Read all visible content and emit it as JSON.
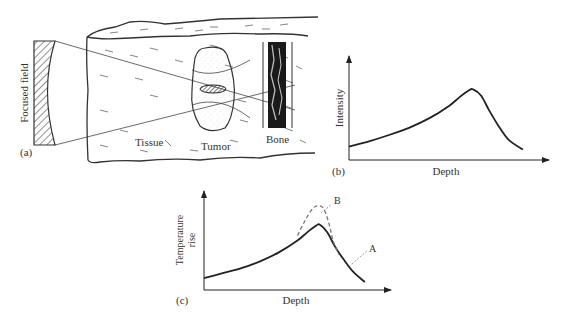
{
  "panel_a": {
    "panel_label": "(a)",
    "transducer_label": "Focused field",
    "region_labels": {
      "tissue": "Tissue",
      "tumor": "Tumor",
      "bone": "Bone"
    }
  },
  "chart_data": [
    {
      "type": "line",
      "panel_label": "(b)",
      "title": "",
      "xlabel": "Depth",
      "ylabel": "Intensity",
      "axis_ticks": "none",
      "series": [
        {
          "name": "Intensity",
          "style": "solid",
          "x": [
            0.0,
            0.1,
            0.2,
            0.3,
            0.4,
            0.5,
            0.55,
            0.6,
            0.62,
            0.66,
            0.7,
            0.75,
            0.8,
            0.87
          ],
          "y": [
            0.13,
            0.18,
            0.24,
            0.31,
            0.4,
            0.52,
            0.6,
            0.67,
            0.68,
            0.62,
            0.48,
            0.32,
            0.19,
            0.1
          ]
        }
      ],
      "xlim": [
        0,
        1
      ],
      "ylim": [
        0,
        1
      ]
    },
    {
      "type": "line",
      "panel_label": "(c)",
      "title": "",
      "xlabel": "Depth",
      "ylabel": "Temperature rise",
      "axis_ticks": "none",
      "series": [
        {
          "name": "A",
          "style": "solid",
          "x": [
            0.0,
            0.1,
            0.2,
            0.3,
            0.4,
            0.5,
            0.55,
            0.6,
            0.62,
            0.66,
            0.7,
            0.75,
            0.8,
            0.86
          ],
          "y": [
            0.12,
            0.17,
            0.22,
            0.29,
            0.38,
            0.5,
            0.58,
            0.65,
            0.66,
            0.58,
            0.44,
            0.3,
            0.18,
            0.08
          ]
        },
        {
          "name": "B",
          "style": "dashed",
          "x": [
            0.5,
            0.54,
            0.58,
            0.61,
            0.64,
            0.67,
            0.69,
            0.72
          ],
          "y": [
            0.55,
            0.7,
            0.82,
            0.85,
            0.82,
            0.66,
            0.5,
            0.36
          ]
        }
      ],
      "annotations": [
        "A",
        "B"
      ],
      "xlim": [
        0,
        1
      ],
      "ylim": [
        0,
        1
      ]
    }
  ]
}
